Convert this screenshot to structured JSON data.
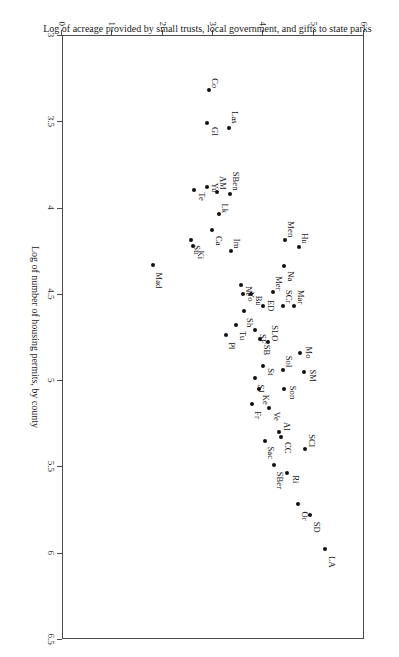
{
  "figure": {
    "rotation_degrees": 90,
    "background": "#ffffff",
    "marker_color": "#111111",
    "axis_color": "#4a4a4a"
  },
  "chart_data": {
    "type": "scatter",
    "title": "",
    "xlabel": "Log of number of housing permits, by county",
    "ylabel": "Log of acreage provided by small trusts, local government, and gifts to state parks",
    "xlim": [
      3,
      6.5
    ],
    "ylim": [
      0,
      6
    ],
    "xticks": [
      3,
      3.5,
      4,
      4.5,
      5,
      5.5,
      6,
      6.5
    ],
    "xticklabels": [
      "3",
      "3.5",
      "4",
      "4.5",
      "5",
      "5.5",
      "6",
      "6.5"
    ],
    "yticks": [
      0,
      1,
      2,
      3,
      4,
      5,
      6
    ],
    "yticklabels": [
      "0",
      "1",
      "2",
      "3",
      "4",
      "5",
      "6"
    ],
    "grid": false,
    "legend": null,
    "points": [
      {
        "label": "LA",
        "x": 5.98,
        "y": 5.22,
        "lx": 7,
        "ly": -11
      },
      {
        "label": "SD",
        "x": 5.78,
        "y": 4.93,
        "lx": 7,
        "ly": -11
      },
      {
        "label": "Or",
        "x": 5.72,
        "y": 4.69,
        "lx": 7,
        "ly": -11
      },
      {
        "label": "Ri",
        "x": 5.54,
        "y": 4.47,
        "lx": 2,
        "ly": -13
      },
      {
        "label": "SBer",
        "x": 5.49,
        "y": 4.22,
        "lx": 7,
        "ly": -10
      },
      {
        "label": "SCl",
        "x": 5.4,
        "y": 4.82,
        "lx": -15,
        "ly": -11
      },
      {
        "label": "CC",
        "x": 5.33,
        "y": 4.36,
        "lx": 5,
        "ly": -11
      },
      {
        "label": "Al",
        "x": 5.3,
        "y": 4.31,
        "lx": -10,
        "ly": -12
      },
      {
        "label": "Sac",
        "x": 5.35,
        "y": 4.03,
        "lx": 6,
        "ly": -10
      },
      {
        "label": "Ve",
        "x": 5.16,
        "y": 4.11,
        "lx": 4,
        "ly": -12
      },
      {
        "label": "Fr",
        "x": 5.14,
        "y": 3.78,
        "lx": 7,
        "ly": -10
      },
      {
        "label": "Son",
        "x": 5.05,
        "y": 4.41,
        "lx": -3,
        "ly": -13
      },
      {
        "label": "Ke",
        "x": 5.05,
        "y": 3.91,
        "lx": 6,
        "ly": -11
      },
      {
        "label": "SJ",
        "x": 4.99,
        "y": 3.84,
        "lx": 6,
        "ly": -10
      },
      {
        "label": "SM",
        "x": 4.95,
        "y": 4.8,
        "lx": -2,
        "ly": -13
      },
      {
        "label": "Sol",
        "x": 4.94,
        "y": 4.4,
        "lx": -14,
        "ly": -10
      },
      {
        "label": "St",
        "x": 4.92,
        "y": 4.0,
        "lx": 2,
        "ly": -12
      },
      {
        "label": "Mo",
        "x": 4.84,
        "y": 4.73,
        "lx": -6,
        "ly": -13
      },
      {
        "label": "SLO",
        "x": 4.78,
        "y": 4.1,
        "lx": -17,
        "ly": -11
      },
      {
        "label": "SB",
        "x": 4.76,
        "y": 3.94,
        "lx": 6,
        "ly": -11
      },
      {
        "label": "SF",
        "x": 4.71,
        "y": 3.83,
        "lx": 4,
        "ly": -12
      },
      {
        "label": "Pl",
        "x": 4.74,
        "y": 3.26,
        "lx": 7,
        "ly": -10
      },
      {
        "label": "Tu",
        "x": 4.68,
        "y": 3.45,
        "lx": 6,
        "ly": -11
      },
      {
        "label": "Sh",
        "x": 4.6,
        "y": 3.62,
        "lx": 7,
        "ly": -10
      },
      {
        "label": "Mar",
        "x": 4.57,
        "y": 4.6,
        "lx": -16,
        "ly": -11
      },
      {
        "label": "SCr",
        "x": 4.57,
        "y": 4.4,
        "lx": -16,
        "ly": -10
      },
      {
        "label": "ED",
        "x": 4.57,
        "y": 3.99,
        "lx": -6,
        "ly": -12
      },
      {
        "label": "Bu",
        "x": 4.5,
        "y": 3.75,
        "lx": 2,
        "ly": -12
      },
      {
        "label": "Yo",
        "x": 4.5,
        "y": 3.6,
        "lx": -2,
        "ly": -12
      },
      {
        "label": "Mer",
        "x": 4.49,
        "y": 4.19,
        "lx": -16,
        "ly": -10
      },
      {
        "label": "Ne",
        "x": 4.45,
        "y": 3.55,
        "lx": 1,
        "ly": -12
      },
      {
        "label": "Na",
        "x": 4.34,
        "y": 4.42,
        "lx": 5,
        "ly": -11
      },
      {
        "label": "Mad",
        "x": 4.33,
        "y": 1.81,
        "lx": 8,
        "ly": -10
      },
      {
        "label": "Im",
        "x": 4.25,
        "y": 3.35,
        "lx": -12,
        "ly": -10
      },
      {
        "label": "Hu",
        "x": 4.23,
        "y": 4.7,
        "lx": -14,
        "ly": -10
      },
      {
        "label": "Ki",
        "x": 4.22,
        "y": 2.6,
        "lx": 5,
        "ly": -12
      },
      {
        "label": "Men",
        "x": 4.19,
        "y": 4.43,
        "lx": -19,
        "ly": -10
      },
      {
        "label": "Su",
        "x": 4.19,
        "y": 2.57,
        "lx": 5,
        "ly": -10
      },
      {
        "label": "Ca",
        "x": 4.13,
        "y": 2.99,
        "lx": 6,
        "ly": -11
      },
      {
        "label": "Lk",
        "x": 4.04,
        "y": 3.12,
        "lx": -11,
        "ly": -10
      },
      {
        "label": "SBen",
        "x": 3.92,
        "y": 3.33,
        "lx": -22,
        "ly": -10
      },
      {
        "label": "AM",
        "x": 3.91,
        "y": 3.07,
        "lx": -16,
        "ly": -10
      },
      {
        "label": "Te",
        "x": 3.9,
        "y": 2.62,
        "lx": 2,
        "ly": -12
      },
      {
        "label": "Yu",
        "x": 3.88,
        "y": 2.88,
        "lx": -4,
        "ly": -12
      },
      {
        "label": "Las",
        "x": 3.54,
        "y": 3.31,
        "lx": -17,
        "ly": -10
      },
      {
        "label": "Gl",
        "x": 3.51,
        "y": 2.88,
        "lx": 4,
        "ly": -12
      },
      {
        "label": "Co",
        "x": 3.32,
        "y": 2.93,
        "lx": -12,
        "ly": -10
      }
    ]
  }
}
